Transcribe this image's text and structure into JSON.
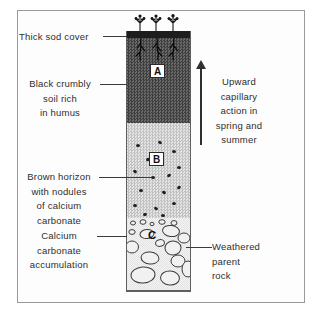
{
  "figure": {
    "type": "soil-profile-diagram",
    "horizon_letters": {
      "a": "A",
      "b": "B",
      "c": "C"
    },
    "left_labels": {
      "thick_sod": "Thick sod cover",
      "black_crumbly": [
        "Black crumbly",
        "soil rich",
        "in humus"
      ],
      "brown_horizon": [
        "Brown horizon",
        "with nodules",
        "of calcium",
        "carbonate"
      ],
      "calcium_accumulation": [
        "Calcium",
        "carbonate",
        "accumulation"
      ]
    },
    "right_labels": {
      "upward_capillary": [
        "Upward",
        "capillary",
        "action in",
        "spring and",
        "summer"
      ],
      "weathered": [
        "Weathered",
        "parent",
        "rock"
      ]
    },
    "colors": {
      "ink": "#2e2e2e",
      "frame": "#9a9a9a",
      "sod_band": "#1d1d1d",
      "horizon_a_dark": "#4f4f4f",
      "horizon_b_gray": "#d3d3d3",
      "horizon_c_light": "#ececec",
      "rock_outline": "#3c3c3c"
    }
  }
}
